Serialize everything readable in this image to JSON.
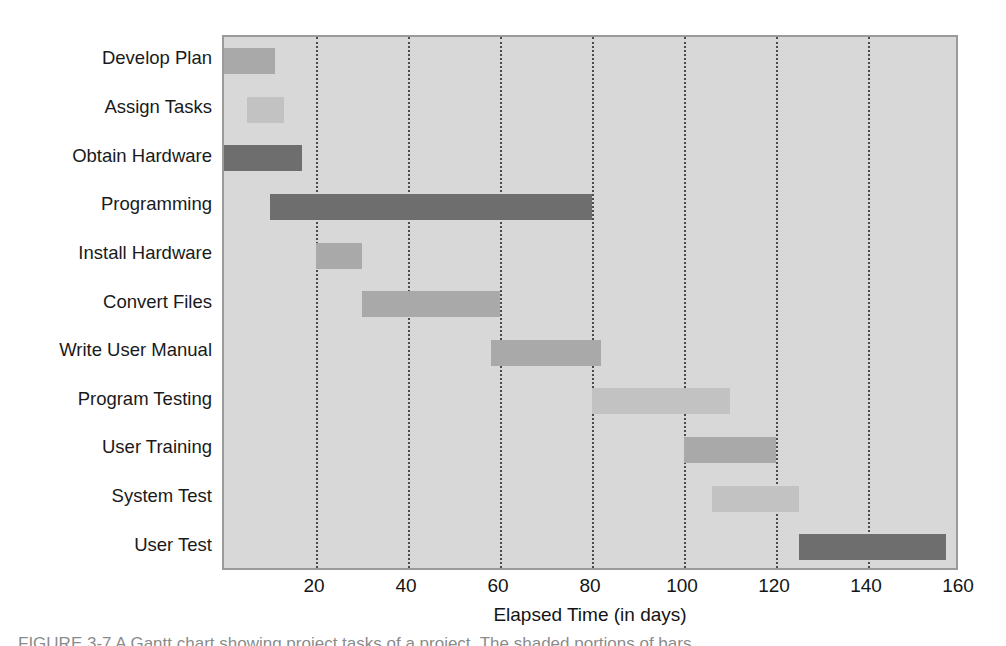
{
  "chart_data": {
    "type": "bar",
    "orientation": "horizontal",
    "subtype": "gantt",
    "title": "",
    "xlabel": "Elapsed Time (in days)",
    "ylabel": "",
    "xlim": [
      0,
      160
    ],
    "xticks": [
      20,
      40,
      60,
      80,
      100,
      120,
      140,
      160
    ],
    "xticklabels": [
      "20",
      "40",
      "60",
      "80",
      "100",
      "120",
      "140",
      "160"
    ],
    "grid": "vertical-dotted",
    "legend": "none",
    "plot_background": "#d8d8d8",
    "categories": [
      "Develop Plan",
      "Assign Tasks",
      "Obtain Hardware",
      "Programming",
      "Install Hardware",
      "Convert Files",
      "Write User Manual",
      "Program Testing",
      "User Training",
      "System Test",
      "User Test"
    ],
    "tasks": [
      {
        "label": "Develop Plan",
        "start": 0,
        "end": 11,
        "duration": 11,
        "shade": "medium"
      },
      {
        "label": "Assign Tasks",
        "start": 5,
        "end": 13,
        "duration": 8,
        "shade": "light"
      },
      {
        "label": "Obtain Hardware",
        "start": 0,
        "end": 17,
        "duration": 17,
        "shade": "dark"
      },
      {
        "label": "Programming",
        "start": 10,
        "end": 80,
        "duration": 70,
        "shade": "dark"
      },
      {
        "label": "Install Hardware",
        "start": 20,
        "end": 30,
        "duration": 10,
        "shade": "medium"
      },
      {
        "label": "Convert Files",
        "start": 30,
        "end": 60,
        "duration": 30,
        "shade": "medium"
      },
      {
        "label": "Write User Manual",
        "start": 58,
        "end": 82,
        "duration": 24,
        "shade": "medium"
      },
      {
        "label": "Program Testing",
        "start": 80,
        "end": 110,
        "duration": 30,
        "shade": "light"
      },
      {
        "label": "User Training",
        "start": 100,
        "end": 120,
        "duration": 20,
        "shade": "medium"
      },
      {
        "label": "System Test",
        "start": 106,
        "end": 125,
        "duration": 19,
        "shade": "light"
      },
      {
        "label": "User Test",
        "start": 125,
        "end": 157,
        "duration": 32,
        "shade": "dark"
      }
    ],
    "colors": {
      "dark": "#6e6e6e",
      "medium": "#a9a9a9",
      "light": "#c2c2c2",
      "gridline": "#4a4a4a",
      "axis": "#9a9a9a"
    }
  },
  "caption": {
    "text": "FIGURE 3-7   A Gantt chart showing project tasks of a project. The shaded portions of bars"
  }
}
